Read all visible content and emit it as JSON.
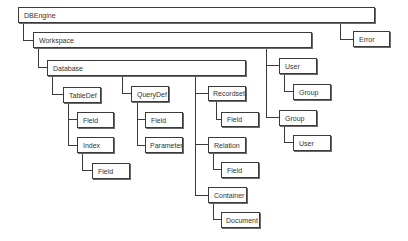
{
  "diagram": {
    "nodes": {
      "dbengine": "DBEngine",
      "error": "Error",
      "workspace": "Workspace",
      "database": "Database",
      "tabledef": "TableDef",
      "tabledef_field": "Field",
      "index": "Index",
      "index_field": "Field",
      "querydef": "QueryDef",
      "querydef_field": "Field",
      "parameter": "Parameter",
      "recordset": "Recordset",
      "recordset_field": "Field",
      "relation": "Relation",
      "relation_field": "Field",
      "container": "Container",
      "document": "Document",
      "user": "User",
      "user_group": "Group",
      "group": "Group",
      "group_user": "User"
    },
    "edges": [
      [
        "DBEngine",
        "Workspace"
      ],
      [
        "DBEngine",
        "Error"
      ],
      [
        "Workspace",
        "Database"
      ],
      [
        "Workspace",
        "User"
      ],
      [
        "Workspace",
        "Group"
      ],
      [
        "Database",
        "TableDef"
      ],
      [
        "Database",
        "QueryDef"
      ],
      [
        "Database",
        "Recordset"
      ],
      [
        "Database",
        "Relation"
      ],
      [
        "Database",
        "Container"
      ],
      [
        "TableDef",
        "Field"
      ],
      [
        "TableDef",
        "Index"
      ],
      [
        "Index",
        "Field"
      ],
      [
        "QueryDef",
        "Field"
      ],
      [
        "QueryDef",
        "Parameter"
      ],
      [
        "Recordset",
        "Field"
      ],
      [
        "Relation",
        "Field"
      ],
      [
        "Container",
        "Document"
      ],
      [
        "User",
        "Group"
      ],
      [
        "Group",
        "User"
      ]
    ]
  }
}
